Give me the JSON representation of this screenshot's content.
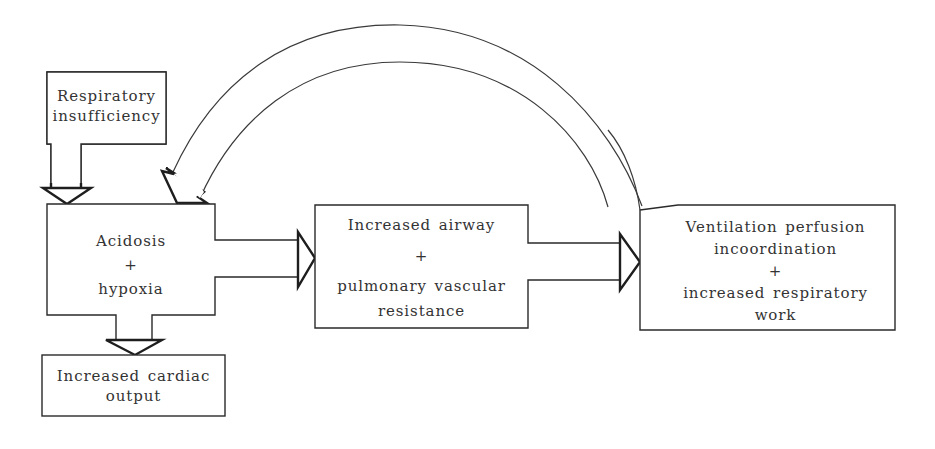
{
  "diagram": {
    "type": "flowchart",
    "nodes": [
      {
        "id": "respiratory_insufficiency",
        "lines": [
          "Respiratory",
          "insufficiency"
        ]
      },
      {
        "id": "acidosis_hypoxia",
        "lines": [
          "Acidosis",
          "+",
          "hypoxia"
        ]
      },
      {
        "id": "increased_cardiac_output",
        "lines": [
          "Increased cardiac",
          "output"
        ]
      },
      {
        "id": "airway_resistance",
        "lines": [
          "Increased airway",
          "+",
          "pulmonary vascular",
          "resistance"
        ]
      },
      {
        "id": "ventilation_perfusion",
        "lines": [
          "Ventilation perfusion",
          "incoordination",
          "+",
          "increased respiratory",
          "work"
        ]
      }
    ],
    "edges": [
      {
        "from": "respiratory_insufficiency",
        "to": "acidosis_hypoxia",
        "style": "block-arrow-down"
      },
      {
        "from": "acidosis_hypoxia",
        "to": "airway_resistance",
        "style": "block-arrow-right"
      },
      {
        "from": "acidosis_hypoxia",
        "to": "increased_cardiac_output",
        "style": "block-arrow-down"
      },
      {
        "from": "airway_resistance",
        "to": "ventilation_perfusion",
        "style": "block-arrow-right"
      },
      {
        "from": "ventilation_perfusion",
        "to": "acidosis_hypoxia",
        "style": "curved-block-arrow-feedback"
      }
    ],
    "colors": {
      "stroke": "#2a2a2a",
      "text": "#333333",
      "background": "#ffffff"
    }
  }
}
